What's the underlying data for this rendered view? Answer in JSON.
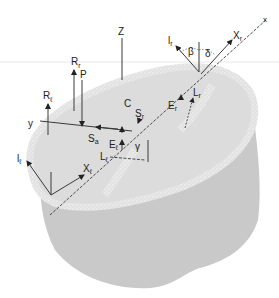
{
  "diagram": {
    "colors": {
      "background": "#ffffff",
      "body_side": "#c9c9c9",
      "top_surface": "#dedede",
      "rim_speckle": "#f4f4f4",
      "line": "#3a3a3a",
      "guide_line": "#e6e6e6"
    },
    "labels": {
      "z_axis": "Z",
      "x_axis": "x",
      "y_axis": "y",
      "center": "C",
      "P": "P",
      "R_r": {
        "main": "R",
        "sub": "r"
      },
      "R_l": {
        "main": "R",
        "sub": "ℓ"
      },
      "S_a": {
        "main": "S",
        "sub": "a"
      },
      "S_r": {
        "main": "S",
        "sub": "r"
      },
      "E_r": {
        "main": "E",
        "sub": "r"
      },
      "E_l": {
        "main": "E",
        "sub": "ℓ"
      },
      "L_r": {
        "main": "L",
        "sub": "r"
      },
      "L_l": {
        "main": "L",
        "sub": "ℓ"
      },
      "X_r": {
        "main": "X",
        "sub": "r"
      },
      "X_l": {
        "main": "X",
        "sub": "ℓ"
      },
      "l_r": {
        "main": "l",
        "sub": "r"
      },
      "l_l": {
        "main": "l",
        "sub": "ℓ"
      },
      "beta": "β",
      "delta": "δ",
      "gamma": "γ"
    }
  }
}
